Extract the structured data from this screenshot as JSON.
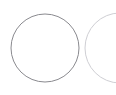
{
  "figure": {
    "name": "two-overlapping-circles",
    "width": 116,
    "height": 95,
    "background_color": "#ffffff"
  },
  "chart_data": {
    "type": "diagram",
    "subtype": "venn",
    "title": "",
    "xlabel": "",
    "ylabel": "",
    "grid": false,
    "legend": "none",
    "annotations": [],
    "shapes": [
      {
        "id": "left-circle",
        "shape": "circle",
        "cx": 45,
        "cy": 48,
        "r": 34,
        "stroke": "#8a8a8f",
        "stroke_width": 1,
        "fill": "none",
        "label": ""
      },
      {
        "id": "right-circle",
        "shape": "circle",
        "cx": 120,
        "cy": 48,
        "r": 35,
        "stroke": "#cfcfd4",
        "stroke_width": 1,
        "fill": "none",
        "label": "",
        "clipped_by_frame": true
      }
    ],
    "intersection_points": [
      {
        "x": 70,
        "y": 22
      },
      {
        "x": 70,
        "y": 74
      }
    ]
  }
}
